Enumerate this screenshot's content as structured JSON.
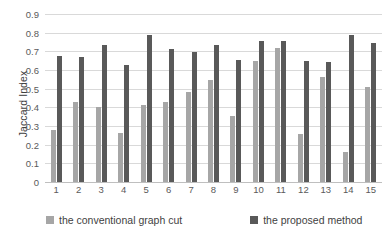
{
  "chart_data": {
    "type": "bar",
    "title": "",
    "xlabel": "",
    "ylabel": "Jaccard Index",
    "ylim": [
      0,
      0.9
    ],
    "ytick_step": 0.1,
    "yticks": [
      "0.9",
      "0.8",
      "0.7",
      "0.6",
      "0.5",
      "0.4",
      "0.3",
      "0.2",
      "0.1",
      "0"
    ],
    "grid": true,
    "legend_position": "bottom",
    "categories": [
      "1",
      "2",
      "3",
      "4",
      "5",
      "6",
      "7",
      "8",
      "9",
      "10",
      "11",
      "12",
      "13",
      "14",
      "15"
    ],
    "series": [
      {
        "name": "the conventional graph cut",
        "color": "#a6a6a6",
        "values": [
          0.28,
          0.43,
          0.4,
          0.265,
          0.41,
          0.43,
          0.48,
          0.545,
          0.355,
          0.65,
          0.72,
          0.255,
          0.56,
          0.16,
          0.51
        ]
      },
      {
        "name": "the proposed method",
        "color": "#595959",
        "values": [
          0.675,
          0.67,
          0.735,
          0.625,
          0.785,
          0.71,
          0.695,
          0.735,
          0.655,
          0.755,
          0.755,
          0.65,
          0.645,
          0.785,
          0.745
        ]
      }
    ]
  },
  "axis": {
    "y_title": "Jaccard Index"
  },
  "legend": {
    "items": [
      {
        "label": "the conventional graph cut",
        "color": "#a6a6a6"
      },
      {
        "label": "the proposed method",
        "color": "#595959"
      }
    ]
  },
  "colors": {
    "series_conventional": "#a6a6a6",
    "series_proposed": "#595959",
    "gridline": "#d9d9d9",
    "axis_text": "#5a5a5a",
    "background": "#ffffff"
  }
}
